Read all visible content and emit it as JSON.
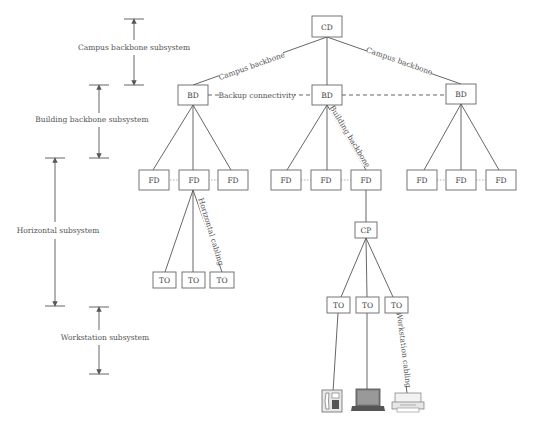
{
  "diagram": {
    "subsystems": [
      {
        "label": "Campus backbone subsystem",
        "top": 19,
        "bottom": 85,
        "x": 134,
        "text_y": 48
      },
      {
        "label": "Building backbone subsystem",
        "top": 85,
        "bottom": 158,
        "x": 99,
        "text_y": 122
      },
      {
        "label": "Horizontal subsystem",
        "top": 158,
        "bottom": 306,
        "x": 55,
        "text_y": 232
      },
      {
        "label": "Workstation subsystem",
        "top": 307,
        "bottom": 374,
        "x": 99,
        "text_y": 338
      }
    ],
    "nodes": {
      "cd": {
        "label": "CD"
      },
      "bd_left": {
        "label": "BD"
      },
      "bd_mid": {
        "label": "BD"
      },
      "bd_right": {
        "label": "BD"
      },
      "fd": [
        "FD",
        "FD",
        "FD",
        "FD",
        "FD",
        "FD",
        "FD",
        "FD",
        "FD"
      ],
      "cp": {
        "label": "CP"
      },
      "to_left": [
        "TO",
        "TO",
        "TO"
      ],
      "to_right": [
        "TO",
        "TO",
        "TO"
      ]
    },
    "link_labels": {
      "campus_backbone_left": "Campus backbone",
      "campus_backbone_right": "Campus backbone",
      "backup_connectivity": "Backup connectivity",
      "building_backbone": "Building backbone",
      "horizontal_cabling": "Horizontal cabling",
      "workstation_cabling": "Workstation cabling"
    },
    "devices": [
      "telephone",
      "laptop",
      "printer"
    ],
    "colors": {
      "line": "#555555",
      "box_stroke": "#666666",
      "text": "#555555"
    }
  }
}
